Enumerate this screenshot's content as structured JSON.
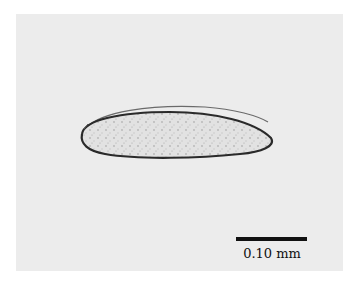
{
  "figure": {
    "background_color": "#ececec",
    "specimen_outline_color": "#2a2a2a",
    "specimen_fill_color": "#dcdcdc"
  },
  "scale_bar": {
    "label": "0.10 mm",
    "color": "#111111"
  }
}
